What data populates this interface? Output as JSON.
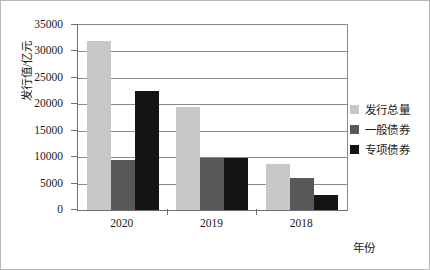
{
  "chart_data": {
    "type": "bar",
    "title": "",
    "xlabel": "年份",
    "ylabel": "发行值/亿元",
    "categories": [
      "2020",
      "2019",
      "2018"
    ],
    "series": [
      {
        "name": "发行总量",
        "color": "#c8c8c8",
        "values": [
          32000,
          19500,
          8800
        ]
      },
      {
        "name": "一般债券",
        "color": "#585858",
        "values": [
          9400,
          9900,
          6000
        ]
      },
      {
        "name": "专项债券",
        "color": "#141414",
        "values": [
          22600,
          9900,
          2800
        ]
      }
    ],
    "ylim": [
      0,
      35000
    ],
    "yticks": [
      0,
      5000,
      10000,
      15000,
      20000,
      25000,
      30000,
      35000
    ],
    "ytick_labels": [
      "0",
      "5000",
      "10000",
      "15000",
      "20000",
      "25000",
      "30000",
      "35000"
    ],
    "grid": true,
    "legend_position": "right"
  }
}
